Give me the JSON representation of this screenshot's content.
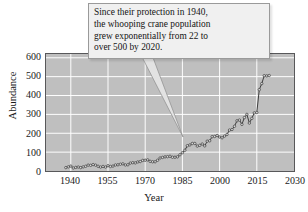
{
  "figure": {
    "background_color": "#ffffff",
    "plot_background_color": "#bfbfbf",
    "grid_color": "#ffffff",
    "line_color": "#3a3a3a",
    "marker_face_color": "#d8d8d8",
    "frame_color": "#58585a"
  },
  "annotation": {
    "name": "whooping-crane-callout",
    "box_fill": "#f0f0f0",
    "box_border": "#9a9a9a",
    "lines": [
      "Since their protection in 1940,",
      "the whooping crane population",
      "grew exponentially from 22 to",
      "over 500 by 2020."
    ],
    "full_text": "Since their protection in 1940, the whooping crane population grew exponentially from 22 to over 500 by 2020."
  },
  "chart_data": {
    "type": "line",
    "title": "",
    "xlabel": "Year",
    "ylabel": "Abundance",
    "xlim": [
      1930,
      2030
    ],
    "ylim": [
      0,
      620
    ],
    "xticks": [
      1940,
      1955,
      1970,
      1985,
      2000,
      2015,
      2030
    ],
    "xticklabels": [
      "1940",
      "1955",
      "1970",
      "1985",
      "2000",
      "2015",
      "2030"
    ],
    "yticks": [
      0,
      100,
      200,
      300,
      400,
      500,
      600
    ],
    "yticklabels": [
      "0",
      "100",
      "200",
      "300",
      "400",
      "500",
      "600"
    ],
    "grid": true,
    "grid_axis": "both",
    "legend": false,
    "marker": "open-circle",
    "series": [
      {
        "name": "Whooping crane abundance",
        "x": [
          1938,
          1939,
          1940,
          1941,
          1942,
          1943,
          1944,
          1945,
          1946,
          1947,
          1948,
          1949,
          1950,
          1951,
          1952,
          1953,
          1954,
          1955,
          1956,
          1957,
          1958,
          1959,
          1960,
          1961,
          1962,
          1963,
          1964,
          1965,
          1966,
          1967,
          1968,
          1969,
          1970,
          1971,
          1972,
          1973,
          1974,
          1975,
          1976,
          1977,
          1978,
          1979,
          1980,
          1981,
          1982,
          1983,
          1984,
          1985,
          1986,
          1987,
          1988,
          1989,
          1990,
          1991,
          1992,
          1993,
          1994,
          1995,
          1996,
          1997,
          1998,
          1999,
          2000,
          2001,
          2002,
          2003,
          2004,
          2005,
          2006,
          2007,
          2008,
          2009,
          2010,
          2011,
          2012,
          2013,
          2014,
          2015,
          2016,
          2017,
          2018,
          2019,
          2020
        ],
        "y": [
          18,
          22,
          26,
          16,
          19,
          21,
          18,
          22,
          25,
          31,
          30,
          34,
          31,
          25,
          21,
          24,
          21,
          28,
          24,
          26,
          32,
          33,
          36,
          38,
          32,
          33,
          42,
          44,
          43,
          48,
          50,
          56,
          57,
          59,
          51,
          49,
          49,
          57,
          69,
          72,
          75,
          76,
          78,
          73,
          73,
          75,
          86,
          97,
          110,
          134,
          138,
          146,
          146,
          132,
          136,
          143,
          133,
          158,
          160,
          182,
          183,
          188,
          180,
          176,
          185,
          194,
          217,
          220,
          237,
          266,
          270,
          247,
          283,
          300,
          254,
          279,
          308,
          310,
          431,
          463,
          505,
          504,
          506
        ],
        "description": "Whooping crane population counts rising from about 22 birds in 1940 to over 500 by 2020"
      }
    ]
  }
}
